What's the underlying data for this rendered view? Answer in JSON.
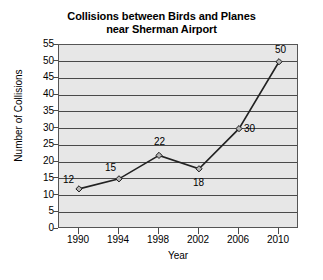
{
  "chart_data": {
    "type": "line",
    "title": "Collisions between Birds and Planes near Sherman Airport",
    "title_lines": [
      "Collisions between Birds and Planes",
      "near Sherman Airport"
    ],
    "xlabel": "Year",
    "ylabel": "Number of Collisions",
    "categories": [
      "1990",
      "1994",
      "1998",
      "2002",
      "2006",
      "2010"
    ],
    "x": [
      1990,
      1994,
      1998,
      2002,
      2006,
      2010
    ],
    "values": [
      12,
      15,
      22,
      18,
      30,
      50
    ],
    "point_labels": [
      "12",
      "15",
      "22",
      "18",
      "30",
      "50"
    ],
    "ylim": [
      0,
      55
    ],
    "ytick_step": 5,
    "yticks": [
      "55",
      "50",
      "45",
      "40",
      "35",
      "30",
      "25",
      "20",
      "15",
      "10",
      "5",
      "0"
    ],
    "xticks": [
      "1990",
      "1994",
      "1998",
      "2002",
      "2006",
      "2010"
    ],
    "grid": "horizontal",
    "legend": "none",
    "colors": {
      "plot_background": "#e7e7e7",
      "page_background": "#ffffff",
      "gridline": "#4a4a4a",
      "axis": "#555555",
      "series_line": "#222222",
      "marker_fill": "#b4b4b4",
      "marker_edge": "#1a1a1a",
      "text": "#000000"
    },
    "marker": "diamond"
  }
}
